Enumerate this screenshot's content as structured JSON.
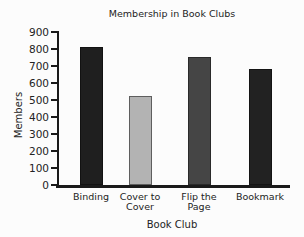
{
  "chart_data": {
    "type": "bar",
    "title": "Membership in Book Clubs",
    "xlabel": "Book Club",
    "ylabel": "Members",
    "categories": [
      "Binding",
      "Cover to Cover",
      "Flip the Page",
      "Bookmark"
    ],
    "values": [
      810,
      525,
      755,
      680
    ],
    "bar_colors": [
      "#1f1f1f",
      "#b3b3b3",
      "#454545",
      "#222222"
    ],
    "bar_border_colors": [
      "#121212",
      "#5e5e5e",
      "#2a2a2a",
      "#141414"
    ],
    "yticks": [
      0,
      100,
      200,
      300,
      400,
      500,
      600,
      700,
      800,
      900
    ],
    "ylim": [
      0,
      900
    ],
    "grid": false,
    "legend": false,
    "axis_color": "#1a1a1a",
    "text_color": "#232323",
    "background": "#fcfcfc"
  }
}
